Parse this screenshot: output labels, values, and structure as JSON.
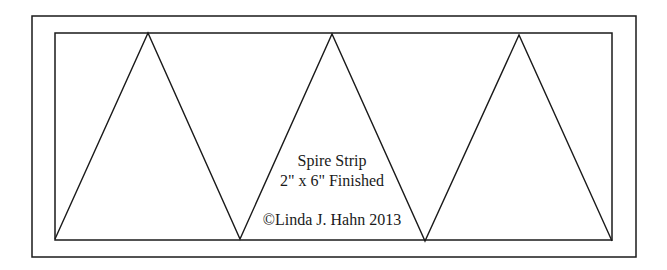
{
  "diagram": {
    "title": "Spire Strip",
    "size_label": "2\" x 6\" Finished",
    "copyright": "©Linda J. Hahn 2013",
    "colors": {
      "line": "#1a1a1a",
      "background": "#ffffff"
    },
    "outer_rect": {
      "x1": 32,
      "y1": 16,
      "x2": 636,
      "y2": 257
    },
    "inner_rect": {
      "x1": 55,
      "y1": 33,
      "x2": 612,
      "y2": 240
    },
    "triangles": [
      {
        "apex": [
          148,
          33
        ],
        "base_left": [
          55,
          238
        ],
        "base_right": [
          240,
          239
        ]
      },
      {
        "apex": [
          332,
          34
        ],
        "base_left": [
          240,
          239
        ],
        "base_right": [
          425,
          241
        ]
      },
      {
        "apex": [
          519,
          35
        ],
        "base_left": [
          425,
          241
        ],
        "base_right": [
          612,
          241
        ]
      }
    ]
  }
}
